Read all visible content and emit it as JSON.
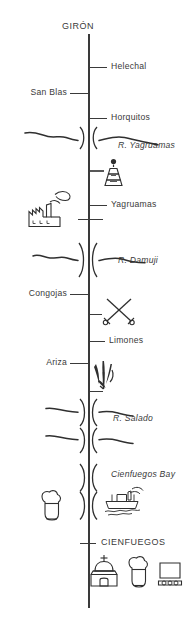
{
  "diagram": {
    "title": "GIRÓN",
    "terminus_bottom": "CIENFUEGOS",
    "orientation": "vertical strip route map",
    "stations": [
      {
        "name": "Helechal",
        "side": "right"
      },
      {
        "name": "San Blas",
        "side": "left"
      },
      {
        "name": "Horquitos",
        "side": "right"
      },
      {
        "name": "Yagruamas",
        "side": "right"
      },
      {
        "name": "Congojas",
        "side": "left"
      },
      {
        "name": "Limones",
        "side": "right"
      },
      {
        "name": "Ariza",
        "side": "left"
      }
    ],
    "water_features": [
      {
        "name": "R. Yagruamas",
        "type": "river"
      },
      {
        "name": "R. Damuji",
        "type": "river"
      },
      {
        "name": "R. Salado",
        "type": "river"
      },
      {
        "name": "Cienfuegos Bay",
        "type": "bay"
      }
    ],
    "symbols": [
      {
        "icon": "beacon-tower-icon",
        "meaning": "beacon / monument tower"
      },
      {
        "icon": "factory-icon",
        "meaning": "sugar mill / factory"
      },
      {
        "icon": "crossed-swords-icon",
        "meaning": "battle site"
      },
      {
        "icon": "sugarcane-plant-icon",
        "meaning": "sugarcane / vegetation"
      },
      {
        "icon": "steamship-icon",
        "meaning": "ship on bay"
      },
      {
        "icon": "pitcher-vessel-icon",
        "meaning": "ceramic vessel landmark"
      },
      {
        "icon": "church-dome-icon",
        "meaning": "church with cross"
      },
      {
        "icon": "monument-screen-icon",
        "meaning": "monument / plaque"
      }
    ],
    "colors": {
      "ink": "#2f2f2f",
      "line": "#3a3a3a",
      "background": "#ffffff"
    }
  }
}
